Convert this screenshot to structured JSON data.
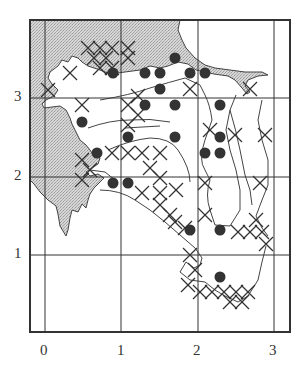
{
  "map": {
    "x_axis": {
      "ticks": [
        "0",
        "1",
        "2",
        "3"
      ]
    },
    "y_axis": {
      "ticks": [
        "1",
        "2",
        "3"
      ]
    },
    "colors": {
      "land": "#c8c8c8",
      "line": "#333333",
      "dot": "#333333",
      "background": "#ffffff"
    },
    "legend_symbols": {
      "dot": "filled circle",
      "cross": "X marker"
    },
    "dots": [
      [
        113,
        73
      ],
      [
        145,
        73
      ],
      [
        160,
        73
      ],
      [
        175,
        58
      ],
      [
        190,
        73
      ],
      [
        205,
        73
      ],
      [
        160,
        89
      ],
      [
        82,
        122
      ],
      [
        145,
        105
      ],
      [
        175,
        105
      ],
      [
        220,
        105
      ],
      [
        128,
        137
      ],
      [
        175,
        137
      ],
      [
        220,
        137
      ],
      [
        97,
        153
      ],
      [
        205,
        153
      ],
      [
        220,
        153
      ],
      [
        113,
        183
      ],
      [
        128,
        183
      ],
      [
        190,
        230
      ],
      [
        220,
        230
      ],
      [
        220,
        277
      ]
    ],
    "crosses": [
      [
        88,
        48
      ],
      [
        100,
        48
      ],
      [
        112,
        48
      ],
      [
        94,
        58
      ],
      [
        106,
        58
      ],
      [
        100,
        68
      ],
      [
        112,
        68
      ],
      [
        128,
        48
      ],
      [
        128,
        58
      ],
      [
        70,
        73
      ],
      [
        48,
        90
      ],
      [
        82,
        105
      ],
      [
        128,
        105
      ],
      [
        138,
        115
      ],
      [
        128,
        125
      ],
      [
        138,
        96
      ],
      [
        190,
        89
      ],
      [
        250,
        89
      ],
      [
        82,
        160
      ],
      [
        90,
        170
      ],
      [
        82,
        180
      ],
      [
        112,
        153
      ],
      [
        128,
        153
      ],
      [
        142,
        153
      ],
      [
        160,
        153
      ],
      [
        150,
        168
      ],
      [
        160,
        178
      ],
      [
        160,
        193
      ],
      [
        142,
        193
      ],
      [
        176,
        190
      ],
      [
        210,
        130
      ],
      [
        235,
        135
      ],
      [
        265,
        135
      ],
      [
        205,
        183
      ],
      [
        260,
        183
      ],
      [
        205,
        215
      ],
      [
        170,
        215
      ],
      [
        160,
        205
      ],
      [
        185,
        228
      ],
      [
        175,
        222
      ],
      [
        190,
        255
      ],
      [
        238,
        232
      ],
      [
        250,
        232
      ],
      [
        262,
        232
      ],
      [
        266,
        244
      ],
      [
        256,
        220
      ],
      [
        195,
        270
      ],
      [
        188,
        285
      ],
      [
        200,
        292
      ],
      [
        212,
        292
      ],
      [
        224,
        292
      ],
      [
        236,
        292
      ],
      [
        248,
        292
      ],
      [
        230,
        302
      ],
      [
        242,
        302
      ]
    ]
  }
}
